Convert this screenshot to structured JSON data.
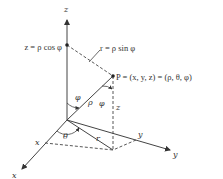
{
  "diagram": {
    "type": "spherical-coordinates",
    "labels": {
      "z_axis": "z",
      "x_axis": "x",
      "y_axis": "y",
      "z_projection": "z = ρ cos φ",
      "r_label": "r = ρ sin φ",
      "point_P": "P = (x, y, z) = (ρ, θ, φ)",
      "phi_at_origin": "φ",
      "rho": "ρ",
      "phi_at_P": "φ",
      "z_height": "z",
      "theta": "θ",
      "r_in_plane": "r",
      "x_coord": "x",
      "y_coord": "y"
    },
    "colors": {
      "line": "#444444",
      "text": "#333333",
      "background": "#ffffff"
    }
  }
}
